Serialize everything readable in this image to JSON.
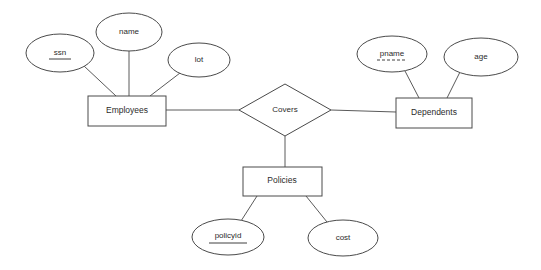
{
  "diagram": {
    "type": "entity-relationship-diagram",
    "background_color": "#ffffff",
    "line_color": "#4a4a4a",
    "text_color": "#2b2b2b",
    "entities": [
      {
        "id": "employees",
        "label": "Employees",
        "shape": "rectangle",
        "x": 88,
        "y": 96,
        "w": 78,
        "h": 30
      },
      {
        "id": "dependents",
        "label": "Dependents",
        "shape": "rectangle",
        "x": 396,
        "y": 98,
        "w": 76,
        "h": 30
      },
      {
        "id": "policies",
        "label": "Policies",
        "shape": "rectangle",
        "x": 243,
        "y": 167,
        "w": 79,
        "h": 29
      }
    ],
    "relationships": [
      {
        "id": "covers",
        "label": "Covers",
        "shape": "diamond",
        "cx": 285,
        "cy": 110,
        "rx": 46,
        "ry": 26
      }
    ],
    "attributes": [
      {
        "id": "ssn",
        "label": "ssn",
        "shape": "ellipse",
        "cx": 60,
        "cy": 53,
        "rx": 34,
        "ry": 19,
        "key": "primary",
        "underline": "solid",
        "belongs_to": "employees"
      },
      {
        "id": "name",
        "label": "name",
        "shape": "ellipse",
        "cx": 129,
        "cy": 32,
        "rx": 33,
        "ry": 19,
        "key": "none",
        "underline": "none",
        "belongs_to": "employees"
      },
      {
        "id": "lot",
        "label": "lot",
        "shape": "ellipse",
        "cx": 199,
        "cy": 60,
        "rx": 31,
        "ry": 17,
        "key": "none",
        "underline": "none",
        "belongs_to": "employees"
      },
      {
        "id": "pname",
        "label": "pname",
        "shape": "ellipse",
        "cx": 392,
        "cy": 54,
        "rx": 35,
        "ry": 18,
        "key": "partial",
        "underline": "dashed",
        "belongs_to": "dependents"
      },
      {
        "id": "age",
        "label": "age",
        "shape": "ellipse",
        "cx": 481,
        "cy": 57,
        "rx": 37,
        "ry": 19,
        "key": "none",
        "underline": "none",
        "belongs_to": "dependents"
      },
      {
        "id": "policyid",
        "label": "policyid",
        "shape": "ellipse",
        "cx": 228,
        "cy": 237,
        "rx": 36,
        "ry": 18,
        "key": "primary",
        "underline": "solid",
        "belongs_to": "policies"
      },
      {
        "id": "cost",
        "label": "cost",
        "shape": "ellipse",
        "cx": 343,
        "cy": 238,
        "rx": 35,
        "ry": 18,
        "key": "none",
        "underline": "none",
        "belongs_to": "policies"
      }
    ],
    "edges": [
      {
        "id": "edge-ssn-employees",
        "from": "ssn",
        "to": "employees",
        "x1": 84,
        "y1": 66,
        "x2": 116,
        "y2": 96
      },
      {
        "id": "edge-name-employees",
        "from": "name",
        "to": "employees",
        "x1": 129,
        "y1": 51,
        "x2": 129,
        "y2": 96
      },
      {
        "id": "edge-lot-employees",
        "from": "lot",
        "to": "employees",
        "x1": 180,
        "y1": 73,
        "x2": 150,
        "y2": 96
      },
      {
        "id": "edge-employees-covers",
        "from": "employees",
        "to": "covers",
        "x1": 166,
        "y1": 110,
        "x2": 239,
        "y2": 110
      },
      {
        "id": "edge-covers-dependents",
        "from": "covers",
        "to": "dependents",
        "x1": 331,
        "y1": 110,
        "x2": 396,
        "y2": 112
      },
      {
        "id": "edge-covers-policies",
        "from": "covers",
        "to": "policies",
        "x1": 285,
        "y1": 136,
        "x2": 285,
        "y2": 167
      },
      {
        "id": "edge-pname-dependents",
        "from": "pname",
        "to": "dependents",
        "x1": 405,
        "y1": 71,
        "x2": 419,
        "y2": 98
      },
      {
        "id": "edge-age-dependents",
        "from": "age",
        "to": "dependents",
        "x1": 460,
        "y1": 72,
        "x2": 447,
        "y2": 98
      },
      {
        "id": "edge-policies-policyid",
        "from": "policies",
        "to": "policyid",
        "x1": 257,
        "y1": 196,
        "x2": 241,
        "y2": 221
      },
      {
        "id": "edge-policies-cost",
        "from": "policies",
        "to": "cost",
        "x1": 306,
        "y1": 196,
        "x2": 327,
        "y2": 222
      }
    ]
  }
}
